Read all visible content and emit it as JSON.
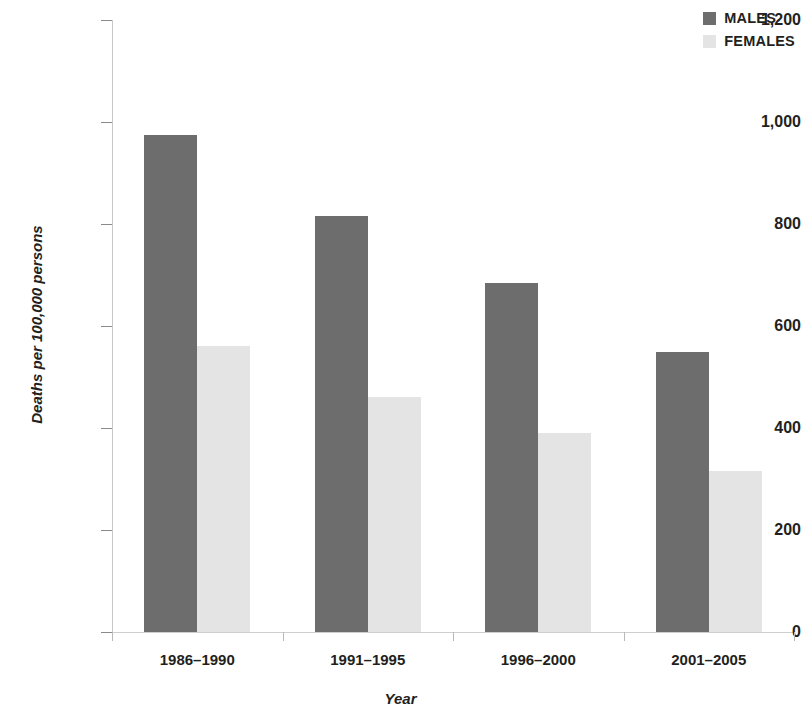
{
  "chart_data": {
    "type": "bar",
    "title": "",
    "subtitle": "",
    "xlabel": "Year",
    "ylabel": "Deaths per 100,000 persons",
    "categories": [
      "1986–1990",
      "1991–1995",
      "1996–2000",
      "2001–2005"
    ],
    "series": [
      {
        "name": "MALES",
        "color": "#6d6d6d",
        "values": [
          975,
          815,
          685,
          550
        ]
      },
      {
        "name": "FEMALES",
        "color": "#e4e4e4",
        "values": [
          560,
          460,
          390,
          315
        ]
      }
    ],
    "ylim": [
      0,
      1200
    ],
    "ytick_values": [
      0,
      200,
      400,
      600,
      800,
      1000,
      1200
    ],
    "ytick_labels": [
      "0",
      "200",
      "400",
      "600",
      "800",
      "1,000",
      "1,200"
    ],
    "grid": false,
    "legend_position": "top-right",
    "annotations": []
  },
  "legend": {
    "items": [
      {
        "label": "MALES",
        "swatch_color": "#6d6d6d",
        "swatch_icon": "legend-square-icon"
      },
      {
        "label": "FEMALES",
        "swatch_color": "#e4e4e4",
        "swatch_icon": "legend-square-icon"
      }
    ]
  }
}
